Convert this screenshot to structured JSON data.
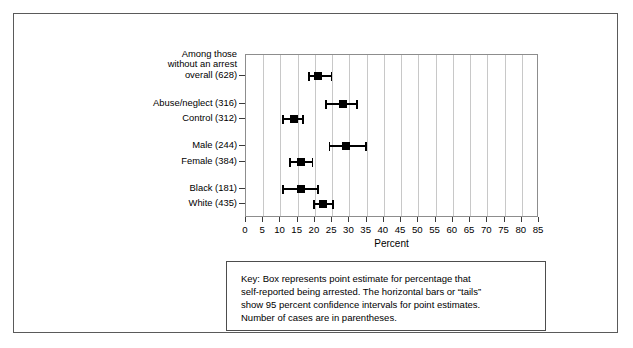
{
  "figure": {
    "xaxis_title": "Percent",
    "key_box": {
      "lines": [
        "Key: Box represents point estimate for percentage that",
        "self-reported being arrested. The horizontal bars or “tails”",
        "show 95 percent confidence intervals for point estimates.",
        "Number of cases are in parentheses."
      ]
    }
  },
  "chart_data": {
    "type": "scatter",
    "title": "",
    "subtitle": "",
    "xlabel": "Percent",
    "ylabel": "",
    "xlim": [
      0,
      85
    ],
    "xticks": [
      0,
      5,
      10,
      15,
      20,
      25,
      30,
      35,
      40,
      45,
      50,
      55,
      60,
      65,
      70,
      75,
      80,
      85
    ],
    "xticklabels": [
      "0",
      "5",
      "10",
      "15",
      "20",
      "25",
      "30",
      "35",
      "40",
      "45",
      "50",
      "55",
      "60",
      "65",
      "70",
      "75",
      "80",
      "85"
    ],
    "grid": "vertical",
    "legend_position": "none",
    "annotations": [
      "Key: Box represents point estimate for percentage that self-reported being arrested. The horizontal bars or “tails” show 95 percent confidence intervals for point estimates. Number of cases are in parentheses."
    ],
    "categories": [
      "Among those without an arrest overall (628)",
      "Abuse/neglect (316)",
      "Control (312)",
      "Male (244)",
      "Female (384)",
      "Black (181)",
      "White (435)"
    ],
    "points": [
      {
        "label_lines": [
          "Among those",
          "without an arrest",
          "overall (628)"
        ],
        "n": 628,
        "estimate": 21.0,
        "ci_low": 18.0,
        "ci_high": 25.0,
        "row": 0
      },
      {
        "label_lines": [
          "Abuse/neglect (316)"
        ],
        "n": 316,
        "estimate": 28.0,
        "ci_low": 23.0,
        "ci_high": 32.5,
        "row": 1
      },
      {
        "label_lines": [
          "Control (312)"
        ],
        "n": 312,
        "estimate": 13.8,
        "ci_low": 10.5,
        "ci_high": 16.8,
        "row": 2
      },
      {
        "label_lines": [
          "Male (244)"
        ],
        "n": 244,
        "estimate": 29.0,
        "ci_low": 24.0,
        "ci_high": 35.0,
        "row": 3
      },
      {
        "label_lines": [
          "Female (384)"
        ],
        "n": 384,
        "estimate": 16.0,
        "ci_low": 12.5,
        "ci_high": 19.5,
        "row": 4
      },
      {
        "label_lines": [
          "Black (181)"
        ],
        "n": 181,
        "estimate": 16.0,
        "ci_low": 10.5,
        "ci_high": 21.2,
        "row": 5
      },
      {
        "label_lines": [
          "White (435)"
        ],
        "n": 435,
        "estimate": 22.3,
        "ci_low": 19.5,
        "ci_high": 25.5,
        "row": 6
      }
    ],
    "row_y_px": [
      61,
      89,
      104,
      131,
      147,
      174,
      189
    ],
    "colors": {
      "marker": "#000000",
      "gridline": "#c8c8c8",
      "axis": "#8d8d8d",
      "frame": "#5a5a5a",
      "text": "#000000"
    }
  }
}
